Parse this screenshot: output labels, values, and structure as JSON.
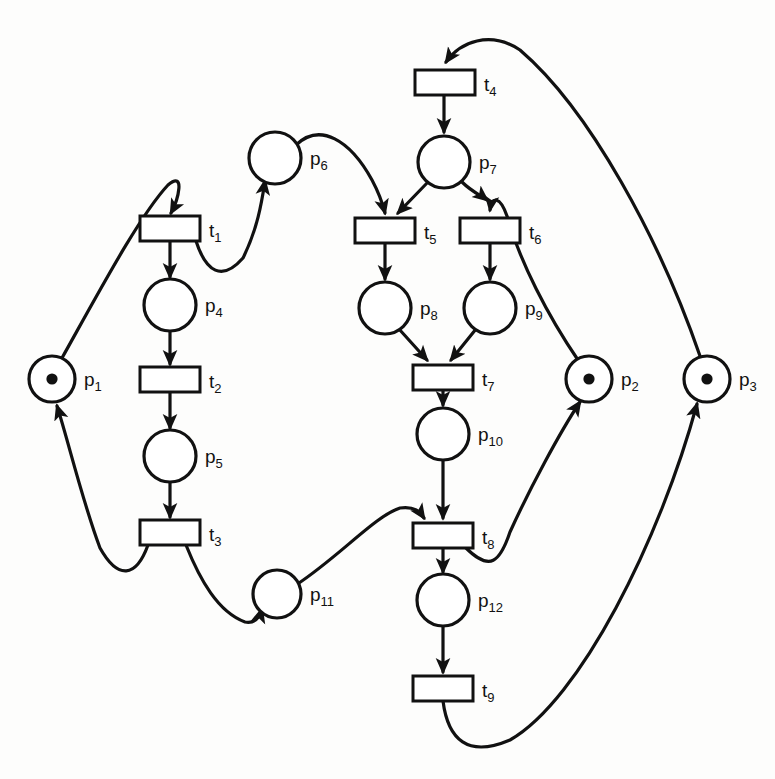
{
  "diagram": {
    "type": "petri-net",
    "width": 775,
    "height": 779,
    "colors": {
      "stroke": "#111111",
      "fill": "#ffffff",
      "background": "#fdfdfc",
      "faded": "#d8d5d0"
    }
  },
  "places": [
    {
      "id": "p1",
      "label": "p",
      "sub": "1",
      "cx": 52,
      "cy": 379,
      "r": 23,
      "tokens": 1
    },
    {
      "id": "p2",
      "label": "p",
      "sub": "2",
      "cx": 589,
      "cy": 379,
      "r": 23,
      "tokens": 1
    },
    {
      "id": "p3",
      "label": "p",
      "sub": "3",
      "cx": 707,
      "cy": 379,
      "r": 23,
      "tokens": 1
    },
    {
      "id": "p4",
      "label": "p",
      "sub": "4",
      "cx": 170,
      "cy": 305,
      "r": 26,
      "tokens": 0
    },
    {
      "id": "p5",
      "label": "p",
      "sub": "5",
      "cx": 170,
      "cy": 456,
      "r": 26,
      "tokens": 0
    },
    {
      "id": "p6",
      "label": "p",
      "sub": "6",
      "cx": 275,
      "cy": 158,
      "r": 26,
      "tokens": 0
    },
    {
      "id": "p7",
      "label": "p",
      "sub": "7",
      "cx": 444,
      "cy": 162,
      "r": 26,
      "tokens": 0
    },
    {
      "id": "p8",
      "label": "p",
      "sub": "8",
      "cx": 385,
      "cy": 308,
      "r": 26,
      "tokens": 0
    },
    {
      "id": "p9",
      "label": "p",
      "sub": "9",
      "cx": 490,
      "cy": 308,
      "r": 26,
      "tokens": 0
    },
    {
      "id": "p10",
      "label": "p",
      "sub": "10",
      "cx": 443,
      "cy": 434,
      "r": 26,
      "tokens": 0
    },
    {
      "id": "p11",
      "label": "p",
      "sub": "11",
      "cx": 277,
      "cy": 594,
      "r": 24,
      "tokens": 0
    },
    {
      "id": "p12",
      "label": "p",
      "sub": "12",
      "cx": 443,
      "cy": 600,
      "r": 26,
      "tokens": 0
    }
  ],
  "transitions": [
    {
      "id": "t1",
      "label": "t",
      "sub": "1",
      "x": 140,
      "y": 216,
      "w": 60,
      "h": 25
    },
    {
      "id": "t2",
      "label": "t",
      "sub": "2",
      "x": 140,
      "y": 367,
      "w": 60,
      "h": 25
    },
    {
      "id": "t3",
      "label": "t",
      "sub": "3",
      "x": 140,
      "y": 520,
      "w": 60,
      "h": 25
    },
    {
      "id": "t4",
      "label": "t",
      "sub": "4",
      "x": 415,
      "y": 70,
      "w": 60,
      "h": 25
    },
    {
      "id": "t5",
      "label": "t",
      "sub": "5",
      "x": 355,
      "y": 218,
      "w": 60,
      "h": 25
    },
    {
      "id": "t6",
      "label": "t",
      "sub": "6",
      "x": 460,
      "y": 218,
      "w": 60,
      "h": 25
    },
    {
      "id": "t7",
      "label": "t",
      "sub": "7",
      "x": 413,
      "y": 365,
      "w": 60,
      "h": 25
    },
    {
      "id": "t8",
      "label": "t",
      "sub": "8",
      "x": 413,
      "y": 523,
      "w": 60,
      "h": 25
    },
    {
      "id": "t9",
      "label": "t",
      "sub": "9",
      "x": 413,
      "y": 676,
      "w": 60,
      "h": 25
    }
  ],
  "arcs": [
    {
      "id": "a1",
      "from": "p1",
      "to": "t1",
      "d": "M 62 358 C 100 290 140 215 168 185 C 186 170 178 200 171 213"
    },
    {
      "id": "a2",
      "from": "t1",
      "to": "p4",
      "d": "M 170 241 L 170 277"
    },
    {
      "id": "a3",
      "from": "t1",
      "to": "p6",
      "d": "M 196 241 C 206 272 222 282 243 258 C 258 228 262 200 265 181"
    },
    {
      "id": "a4",
      "from": "p4",
      "to": "t2",
      "d": "M 170 331 L 170 364"
    },
    {
      "id": "a5",
      "from": "t2",
      "to": "p5",
      "d": "M 170 392 L 170 428"
    },
    {
      "id": "a6",
      "from": "p5",
      "to": "t3",
      "d": "M 170 482 L 170 517"
    },
    {
      "id": "a7",
      "from": "t3",
      "to": "p1",
      "d": "M 148 545 C 136 578 118 580 100 548 C 82 500 68 440 57 406"
    },
    {
      "id": "a8",
      "from": "t3",
      "to": "p11",
      "d": "M 186 545 C 200 580 218 612 245 622 C 256 624 260 616 262 609"
    },
    {
      "id": "a9",
      "from": "p6",
      "to": "t5",
      "d": "M 296 145 C 320 122 350 140 372 180 C 380 195 383 205 385 213"
    },
    {
      "id": "a10",
      "from": "p7",
      "to": "t5",
      "d": "M 428 182 L 398 213"
    },
    {
      "id": "a11",
      "from": "p7",
      "to": "t6",
      "d": "M 462 182 C 472 192 482 196 487 200"
    },
    {
      "id": "a12",
      "from": "t4",
      "to": "p7",
      "d": "M 444 95 L 444 132"
    },
    {
      "id": "a13",
      "from": "p3",
      "to": "t4",
      "d": "M 700 356 C 660 240 590 110 520 50 C 490 30 460 42 446 62"
    },
    {
      "id": "a14",
      "from": "t5",
      "to": "p8",
      "d": "M 385 243 L 385 279"
    },
    {
      "id": "a15",
      "from": "t6",
      "to": "p9",
      "d": "M 490 243 L 490 279"
    },
    {
      "id": "a16",
      "from": "p2",
      "to": "t6",
      "d": "M 578 360 C 548 316 520 262 507 216 C 500 196 492 196 490 210"
    },
    {
      "id": "a17",
      "from": "p8",
      "to": "t7",
      "d": "M 399 329 L 427 360"
    },
    {
      "id": "a18",
      "from": "p9",
      "to": "t7",
      "d": "M 476 329 L 451 360"
    },
    {
      "id": "a19",
      "from": "t7",
      "to": "p10",
      "d": "M 443 390 L 443 405"
    },
    {
      "id": "a20",
      "from": "p10",
      "to": "t8",
      "d": "M 443 460 L 443 518"
    },
    {
      "id": "a21",
      "from": "p11",
      "to": "t8",
      "d": "M 296 585 C 340 556 375 516 400 508 C 415 506 420 512 424 518"
    },
    {
      "id": "a22",
      "from": "t8",
      "to": "p12",
      "d": "M 443 548 L 443 572"
    },
    {
      "id": "a23",
      "from": "t8",
      "to": "p2",
      "d": "M 466 548 C 490 572 500 562 510 532 C 530 488 560 432 580 402"
    },
    {
      "id": "a24",
      "from": "t9",
      "to": "p3",
      "d": "M 443 701 C 448 740 468 758 510 740 C 580 700 660 540 697 404"
    },
    {
      "id": "a25",
      "from": "p12",
      "to": "t9",
      "d": "M 443 626 L 443 672"
    }
  ],
  "background_notes": [
    {
      "id": "bg1",
      "text": "...",
      "x": 560,
      "y": 630
    },
    {
      "id": "bg2",
      "text": "6.3 shows",
      "x": 560,
      "y": 700
    },
    {
      "id": "bg3",
      "text": "is ...",
      "x": 560,
      "y": 725
    }
  ]
}
